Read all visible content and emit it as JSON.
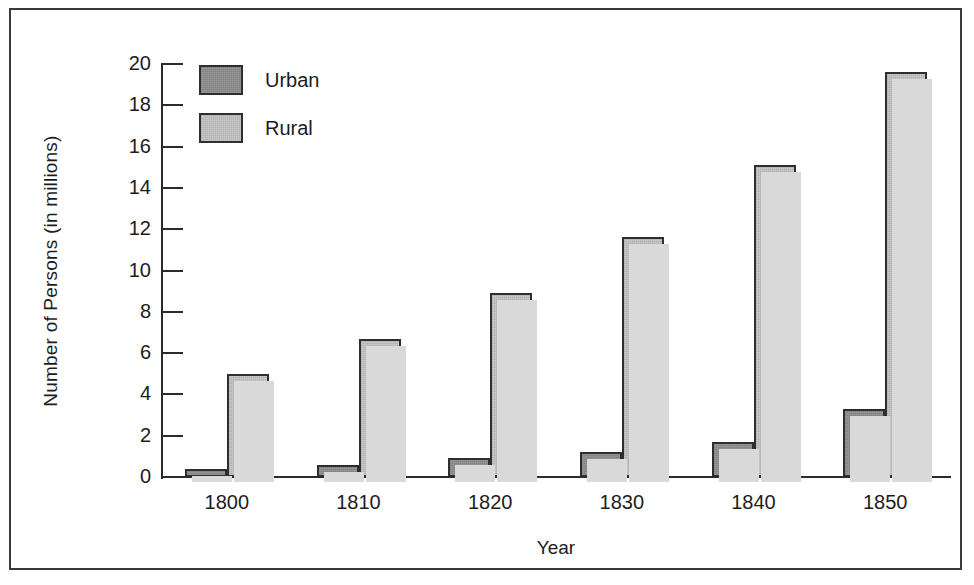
{
  "chart_data": {
    "type": "bar",
    "title": "",
    "xlabel": "Year",
    "ylabel": "Number of Persons (in millions)",
    "categories": [
      "1800",
      "1810",
      "1820",
      "1830",
      "1840",
      "1850"
    ],
    "series": [
      {
        "name": "Urban",
        "color": "#8b8b8b",
        "values": [
          0.4,
          0.6,
          0.9,
          1.2,
          1.7,
          3.3
        ]
      },
      {
        "name": "Rural",
        "color": "#bdbdbd",
        "values": [
          5.0,
          6.7,
          8.9,
          11.6,
          15.1,
          19.6
        ]
      }
    ],
    "ylim": [
      0,
      20
    ],
    "ytick_labels": [
      "20",
      "18",
      "16",
      "14",
      "12",
      "10",
      "8",
      "6",
      "4",
      "2",
      "0"
    ],
    "ytick_values": [
      20,
      18,
      16,
      14,
      12,
      10,
      8,
      6,
      4,
      2,
      0
    ],
    "grid": false,
    "legend_position": "top-left-inside",
    "legend": [
      {
        "label": "Urban",
        "color": "#8b8b8b"
      },
      {
        "label": "Rural",
        "color": "#bdbdbd"
      }
    ],
    "axis_color": "#2b2b2b",
    "frame_color": "#3a3a3a",
    "background": "#ffffff"
  }
}
